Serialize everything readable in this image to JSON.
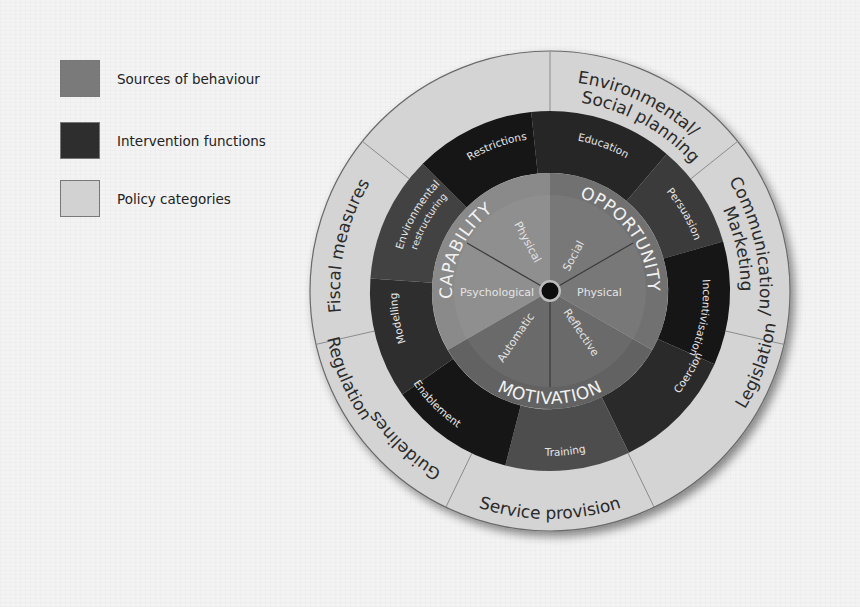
{
  "legend": {
    "items": [
      {
        "label": "Sources of behaviour",
        "color": "#7a7a7a"
      },
      {
        "label": "Intervention functions",
        "color": "#2e2e2e"
      },
      {
        "label": "Policy categories",
        "color": "#d2d2d2"
      }
    ]
  },
  "wheel": {
    "center": {
      "x": 550,
      "y": 291
    },
    "policy_categories": [
      "Environmental/ Social planning",
      "Communication/ Marketing",
      "Legislation",
      "Service provision",
      "Regulation",
      "Fiscal measures",
      "Guidelines"
    ],
    "policy_lines": {
      "env1": "Environmental/",
      "env2": "Social planning",
      "comm1": "Communication/",
      "comm2": "Marketing",
      "legislation": "Legislation",
      "service": "Service provision",
      "regulation": "Regulation",
      "fiscal": "Fiscal measures",
      "guidelines": "Guidelines"
    },
    "intervention_functions": [
      "Education",
      "Persuasion",
      "Incentivisation",
      "Coercion",
      "Training",
      "Enablement",
      "Modelling",
      "Environmental restructuring",
      "Restrictions"
    ],
    "intervention_lines": {
      "education": "Education",
      "persuasion": "Persuasion",
      "incentivisation": "Incentivisation",
      "coercion": "Coercion",
      "training": "Training",
      "enablement": "Enablement",
      "modelling": "Modelling",
      "env_restr1": "Environmental",
      "env_restr2": "restructuring",
      "restrictions": "Restrictions"
    },
    "sources": {
      "capability": "CAPABILITY",
      "opportunity": "OPPORTUNITY",
      "motivation": "MOTIVATION"
    },
    "components": {
      "psychological": "Psychological",
      "physical_capability": "Physical",
      "social": "Social",
      "physical_opportunity": "Physical",
      "reflective": "Reflective",
      "automatic": "Automatic"
    },
    "colors": {
      "policy_ring": "#d4d4d4",
      "policy_divider": "#8a8a8a",
      "function_dark": "#1e1e1e",
      "function_mid": "#333333",
      "function_light": "#484848",
      "source_capability": "#878787",
      "source_opportunity": "#6e6e6e",
      "source_motivation": "#5f5f5f",
      "center_dot": "#0d0d0d"
    }
  }
}
